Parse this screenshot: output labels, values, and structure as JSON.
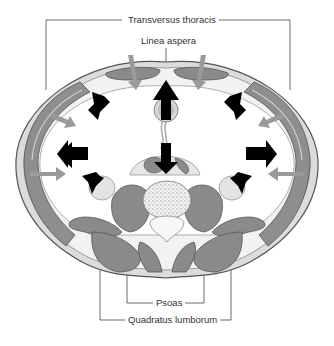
{
  "figure": {
    "labels": {
      "top_label": "Transversus thoracis",
      "top_inner_label": "Linea aspera",
      "bottom_inner_label": "Psoas",
      "bottom_label": "Quadratus lumborum"
    },
    "colors": {
      "muscle": "#8a8a8a",
      "muscle_dark": "#6f6f6f",
      "wall_light": "#d9d9d9",
      "fascia": "#efefef",
      "arrow_black": "#000000",
      "arrow_grey": "#9a9a9a",
      "line": "#444444"
    },
    "arrows": {
      "black_outward_count": 9,
      "grey_inward_count": 6
    }
  }
}
